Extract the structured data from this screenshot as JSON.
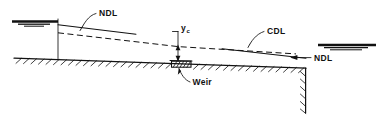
{
  "figure": {
    "type": "hydraulic-profile-diagram",
    "title": "",
    "background_color": "#ffffff",
    "line_color": "#111111",
    "width": 383,
    "height": 123
  },
  "labels": {
    "ndl_upstream": "NDL",
    "cdl": "CDL",
    "ndl_downstream": "NDL",
    "weir": "Weir",
    "yc_main": "y",
    "yc_subscript": "c"
  },
  "elements": {
    "upstream_reservoir": {
      "name": "upstream water surface symbol",
      "x_start": 12,
      "x_end": 58,
      "y": 22
    },
    "upstream_wall": {
      "name": "vertical wall",
      "x": 58,
      "y_top": 20,
      "y_bottom": 60
    },
    "ndl_upstream_line": {
      "name": "normal depth line upstream",
      "style": "solid",
      "points": "58,25 136,34"
    },
    "cdl_line": {
      "name": "critical depth line",
      "style": "dashed",
      "points": "58,33 178,47 296,54"
    },
    "yc_dimension": {
      "name": "critical depth dimension",
      "x": 178,
      "y_top": 47,
      "y_bottom": 62
    },
    "weir_block": {
      "name": "weir structure",
      "x": 171,
      "y": 61,
      "width": 22,
      "height": 6
    },
    "ndl_downstream_line": {
      "name": "normal depth line downstream",
      "style": "solid",
      "points": "222,49 305,58"
    },
    "downstream_reservoir": {
      "name": "downstream water surface symbol",
      "x_start": 318,
      "x_end": 376,
      "y": 45
    },
    "ground_line": {
      "name": "channel bed with hatching",
      "points": "14,58 305,68"
    },
    "drop_wall": {
      "name": "downstream vertical drop",
      "x": 305,
      "y_top": 68,
      "y_bottom": 113
    }
  }
}
